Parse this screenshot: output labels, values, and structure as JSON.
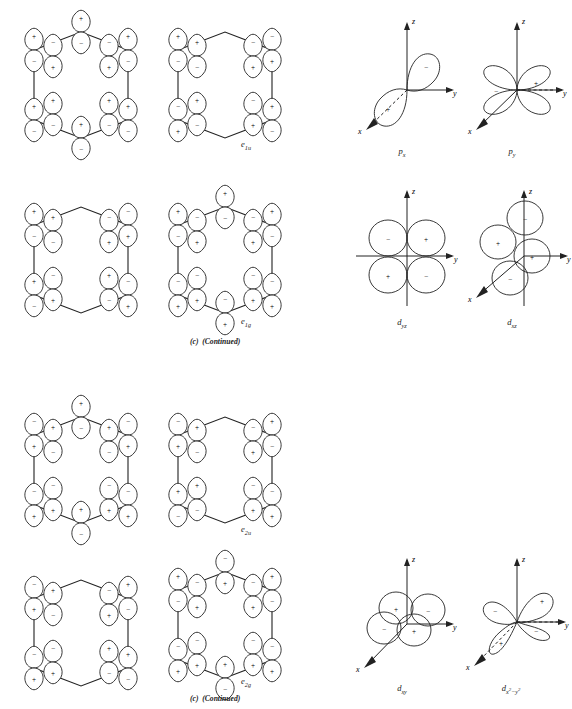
{
  "figure": {
    "kind": "orbital-symmetry-plate",
    "caption_text": "(c)  (Continued)",
    "caption_part": "(c)",
    "caption_note": "(Continued)"
  },
  "mo_labels": {
    "e1u": "e",
    "e1u_sub": "1u",
    "e1g": "e",
    "e1g_sub": "1g",
    "e2u": "e",
    "e2u_sub": "2u",
    "e2g": "e",
    "e2g_sub": "2g"
  },
  "ao_labels": {
    "px_base": "p",
    "px_sub": "x",
    "py_base": "p",
    "py_sub": "y",
    "dyz_base": "d",
    "dyz_sub": "yz",
    "dxz_base": "d",
    "dxz_sub": "xz",
    "dxy_base": "d",
    "dxy_sub": "xy",
    "dx2y2_base": "d",
    "dx2y2_sub_a": "x",
    "dx2y2_sup_a": "2",
    "dx2y2_minus": "−",
    "dx2y2_sub_b": "y",
    "dx2y2_sup_b": "2"
  },
  "axes": {
    "x": "x",
    "y": "y",
    "z": "z"
  },
  "signs": {
    "plus": "+",
    "minus": "−"
  },
  "colors": {
    "ink": "#1a1a1a",
    "stroke": "#2a2a2a",
    "paper": "#ffffff"
  },
  "benzene_mos": [
    {
      "name": "e1u",
      "label_key": "e1u",
      "row": 1,
      "col": 1,
      "has_label": false,
      "vertices": [
        "top",
        "upper-left",
        "upper-right",
        "lower-left",
        "lower-right",
        "bottom"
      ],
      "orbital_signs": {
        "top": {
          "upper": "+",
          "lower": "−"
        },
        "upper_left": {
          "upper": "+",
          "lower": "−"
        },
        "upper_left_inner": {
          "upper": "−",
          "lower": "+"
        },
        "upper_right": {
          "upper": "+",
          "lower": "−"
        },
        "upper_right_inner": {
          "upper": "−",
          "lower": "+"
        },
        "lower_left": {
          "upper": "+",
          "lower": "−"
        },
        "lower_left_inner": {
          "upper": "+",
          "lower": "−"
        },
        "lower_right": {
          "upper": "+",
          "lower": "−"
        },
        "lower_right_inner": {
          "upper": "+",
          "lower": "−"
        },
        "bottom": {
          "upper": "+",
          "lower": "−"
        }
      }
    },
    {
      "name": "e1u-partner",
      "label_key": "e1u",
      "row": 1,
      "col": 2,
      "has_label": true,
      "node_through_top_bottom": true,
      "orbital_signs": {
        "upper_left": {
          "upper": "+",
          "lower": "−"
        },
        "upper_left_inner": {
          "upper": "+",
          "lower": "−"
        },
        "upper_right": {
          "upper": "−",
          "lower": "+"
        },
        "upper_right_inner": {
          "upper": "−",
          "lower": "+"
        },
        "lower_left": {
          "upper": "−",
          "lower": "+"
        },
        "lower_left_inner": {
          "upper": "+",
          "lower": "−"
        },
        "lower_right": {
          "upper": "+",
          "lower": "−"
        },
        "lower_right_inner": {
          "upper": "−",
          "lower": "+"
        }
      }
    },
    {
      "name": "e1g-partner",
      "label_key": "e1g",
      "row": 2,
      "col": 1,
      "has_label": false,
      "node_through_top_bottom": true,
      "orbital_signs": {
        "upper_left": {
          "upper": "+",
          "lower": "−"
        },
        "upper_left_inner": {
          "upper": "+",
          "lower": "−"
        },
        "upper_right": {
          "upper": "−",
          "lower": "+"
        },
        "upper_right_inner": {
          "upper": "−",
          "lower": "+"
        },
        "lower_left": {
          "upper": "+",
          "lower": "−"
        },
        "lower_left_inner": {
          "upper": "−",
          "lower": "+"
        },
        "lower_right": {
          "upper": "−",
          "lower": "+"
        },
        "lower_right_inner": {
          "upper": "+",
          "lower": "−"
        }
      }
    },
    {
      "name": "e1g",
      "label_key": "e1g",
      "row": 2,
      "col": 2,
      "has_label": true,
      "orbital_signs": {
        "top": {
          "upper": "+",
          "lower": "−"
        },
        "upper_left": {
          "upper": "+",
          "lower": "−"
        },
        "upper_left_inner": {
          "upper": "−",
          "lower": "+"
        },
        "upper_right": {
          "upper": "+",
          "lower": "−"
        },
        "upper_right_inner": {
          "upper": "−",
          "lower": "+"
        },
        "lower_left": {
          "upper": "−",
          "lower": "+"
        },
        "lower_left_inner": {
          "upper": "−",
          "lower": "+"
        },
        "lower_right": {
          "upper": "−",
          "lower": "+"
        },
        "lower_right_inner": {
          "upper": "−",
          "lower": "+"
        },
        "bottom": {
          "upper": "−",
          "lower": "+"
        }
      }
    },
    {
      "name": "e2u-partner",
      "label_key": "e2u",
      "row": 3,
      "col": 1,
      "has_label": false,
      "orbital_signs": {
        "top": {
          "upper": "+",
          "lower": "−"
        },
        "upper_left": {
          "upper": "−",
          "lower": "+"
        },
        "upper_left_inner": {
          "upper": "+",
          "lower": "−"
        },
        "upper_right": {
          "upper": "−",
          "lower": "+"
        },
        "upper_right_inner": {
          "upper": "+",
          "lower": "−"
        },
        "lower_left": {
          "upper": "−",
          "lower": "+"
        },
        "lower_left_inner": {
          "upper": "−",
          "lower": "+"
        },
        "lower_right": {
          "upper": "−",
          "lower": "+"
        },
        "lower_right_inner": {
          "upper": "−",
          "lower": "+"
        },
        "bottom": {
          "upper": "+",
          "lower": "−"
        }
      }
    },
    {
      "name": "e2u",
      "label_key": "e2u",
      "row": 3,
      "col": 2,
      "has_label": true,
      "node_through_top_bottom": true,
      "orbital_signs": {
        "upper_left": {
          "upper": "−",
          "lower": "+"
        },
        "upper_left_inner": {
          "upper": "+",
          "lower": "−"
        },
        "upper_right": {
          "upper": "+",
          "lower": "−"
        },
        "upper_right_inner": {
          "upper": "−",
          "lower": "+"
        },
        "lower_left": {
          "upper": "+",
          "lower": "−"
        },
        "lower_left_inner": {
          "upper": "+",
          "lower": "−"
        },
        "lower_right": {
          "upper": "−",
          "lower": "+"
        },
        "lower_right_inner": {
          "upper": "−",
          "lower": "+"
        }
      }
    },
    {
      "name": "e2g-partner",
      "label_key": "e2g",
      "row": 4,
      "col": 1,
      "has_label": false,
      "node_through_top_bottom": true,
      "orbital_signs": {
        "upper_left": {
          "upper": "−",
          "lower": "+"
        },
        "upper_left_inner": {
          "upper": "+",
          "lower": "−"
        },
        "upper_right": {
          "upper": "+",
          "lower": "−"
        },
        "upper_right_inner": {
          "upper": "−",
          "lower": "+"
        },
        "lower_left": {
          "upper": "−",
          "lower": "+"
        },
        "lower_left_inner": {
          "upper": "−",
          "lower": "+"
        },
        "lower_right": {
          "upper": "+",
          "lower": "−"
        },
        "lower_right_inner": {
          "upper": "+",
          "lower": "−"
        }
      }
    },
    {
      "name": "e2g",
      "label_key": "e2g",
      "row": 4,
      "col": 2,
      "has_label": true,
      "orbital_signs": {
        "top": {
          "upper": "−",
          "lower": "+"
        },
        "upper_left": {
          "upper": "+",
          "lower": "−"
        },
        "upper_left_inner": {
          "upper": "−",
          "lower": "+"
        },
        "upper_right": {
          "upper": "+",
          "lower": "−"
        },
        "upper_right_inner": {
          "upper": "−",
          "lower": "+"
        },
        "lower_left": {
          "upper": "−",
          "lower": "+"
        },
        "lower_left_inner": {
          "upper": "−",
          "lower": "+"
        },
        "lower_right": {
          "upper": "−",
          "lower": "+"
        },
        "lower_right_inner": {
          "upper": "−",
          "lower": "+"
        },
        "bottom": {
          "upper": "+",
          "lower": "−"
        }
      }
    }
  ],
  "atomic_orbitals": [
    {
      "name": "px",
      "type": "p",
      "row": 1,
      "col": 1,
      "lobes": [
        {
          "sign": "−",
          "direction": "upper-right"
        },
        {
          "sign": "+",
          "direction": "lower-left"
        }
      ],
      "axes_drawn": [
        "z",
        "y",
        "x"
      ]
    },
    {
      "name": "py",
      "type": "p",
      "row": 1,
      "col": 2,
      "lobes": [
        {
          "sign": "−",
          "direction": "left"
        },
        {
          "sign": "+",
          "direction": "right"
        }
      ],
      "axes_drawn": [
        "z",
        "y",
        "x"
      ]
    },
    {
      "name": "dyz",
      "type": "d",
      "row": 2,
      "col": 1,
      "lobes": [
        {
          "sign": "−",
          "direction": "upper-left"
        },
        {
          "sign": "+",
          "direction": "upper-right"
        },
        {
          "sign": "+",
          "direction": "lower-left"
        },
        {
          "sign": "−",
          "direction": "lower-right"
        }
      ],
      "axes_drawn": [
        "z",
        "y"
      ]
    },
    {
      "name": "dxz",
      "type": "d",
      "row": 2,
      "col": 2,
      "lobes": [
        {
          "sign": "−",
          "direction": "top"
        },
        {
          "sign": "+",
          "direction": "left"
        },
        {
          "sign": "+",
          "direction": "right"
        },
        {
          "sign": "−",
          "direction": "bottom"
        }
      ],
      "axes_drawn": [
        "z",
        "y",
        "x"
      ]
    },
    {
      "name": "dxy",
      "type": "d",
      "row": 3,
      "col": 1,
      "lobes": [
        {
          "sign": "+",
          "direction": "upper-left"
        },
        {
          "sign": "−",
          "direction": "upper-right"
        },
        {
          "sign": "−",
          "direction": "lower-left"
        },
        {
          "sign": "+",
          "direction": "lower-right"
        }
      ],
      "axes_drawn": [
        "z",
        "y",
        "x"
      ]
    },
    {
      "name": "dx2-y2",
      "type": "d",
      "row": 3,
      "col": 2,
      "lobes": [
        {
          "sign": "+",
          "direction": "upper-right"
        },
        {
          "sign": "−",
          "direction": "upper-left"
        },
        {
          "sign": "+",
          "direction": "lower-left"
        },
        {
          "sign": "−",
          "direction": "lower-right"
        }
      ],
      "axes_drawn": [
        "z",
        "y",
        "x"
      ]
    }
  ]
}
